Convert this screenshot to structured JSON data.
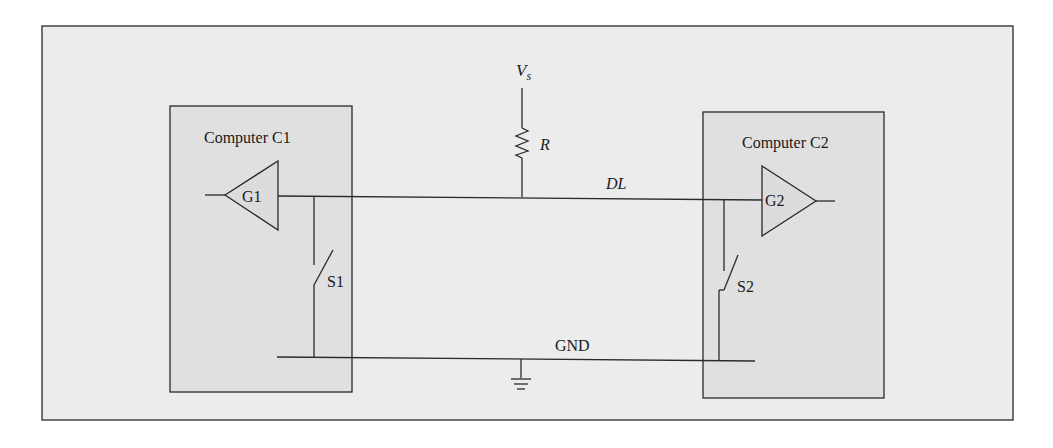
{
  "diagram": {
    "title": "",
    "colors": {
      "background": "#ffffff",
      "panel": "#ececec",
      "box": "#e2e2e2",
      "stroke": "#2a2a2a"
    },
    "computers": [
      {
        "label": "Computer C1",
        "gate": "G1",
        "switch": "S1"
      },
      {
        "label": "Computer C2",
        "gate": "G2",
        "switch": "S2"
      }
    ],
    "supply": {
      "label": "V",
      "subscript": "s"
    },
    "resistor": {
      "label": "R"
    },
    "data_line": {
      "label": "DL"
    },
    "ground": {
      "label": "GND"
    }
  }
}
